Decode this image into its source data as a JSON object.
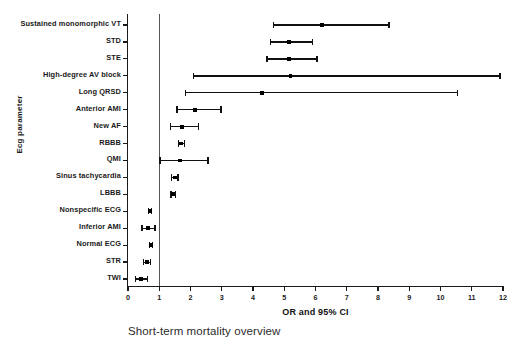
{
  "caption": "Short-term mortality overview",
  "chart_data": {
    "type": "scatter",
    "plot_style": "forest-plot",
    "title": "",
    "subtitle": "",
    "xlabel": "OR and 95% CI",
    "ylabel": "Ecg parameter",
    "xlim": [
      0,
      12
    ],
    "xticks": [
      0,
      1,
      2,
      3,
      4,
      5,
      6,
      7,
      8,
      9,
      10,
      11,
      12
    ],
    "xticklabels": [
      "0",
      "1",
      "2",
      "3",
      "4",
      "5",
      "6",
      "7",
      "8",
      "9",
      "10",
      "11",
      "12"
    ],
    "grid": false,
    "legend": "none",
    "reference_line": 1,
    "categories": [
      "Sustained monomorphic VT",
      "STD",
      "STE",
      "High-degree AV block",
      "Long QRSD",
      "Anterior AMI",
      "New AF",
      "RBBB",
      "QMI",
      "Sinus tachycardia",
      "LBBB",
      "Nonspecific ECG",
      "Inferior AMI",
      "Normal ECG",
      "STR",
      "TWI"
    ],
    "points": [
      {
        "label": "Sustained monomorphic VT",
        "or": 6.2,
        "ci_low": 4.65,
        "ci_high": 8.35
      },
      {
        "label": "STD",
        "or": 5.15,
        "ci_low": 4.55,
        "ci_high": 5.9
      },
      {
        "label": "STE",
        "or": 5.15,
        "ci_low": 4.45,
        "ci_high": 6.05
      },
      {
        "label": "High-degree AV block",
        "or": 5.2,
        "ci_low": 2.1,
        "ci_high": 11.9
      },
      {
        "label": "Long QRSD",
        "or": 4.3,
        "ci_low": 1.85,
        "ci_high": 10.55
      },
      {
        "label": "Anterior AMI",
        "or": 2.15,
        "ci_low": 1.57,
        "ci_high": 2.98
      },
      {
        "label": "New AF",
        "or": 1.73,
        "ci_low": 1.35,
        "ci_high": 2.25
      },
      {
        "label": "RBBB",
        "or": 1.7,
        "ci_low": 1.62,
        "ci_high": 1.8
      },
      {
        "label": "QMI",
        "or": 1.66,
        "ci_low": 1.02,
        "ci_high": 2.56
      },
      {
        "label": "Sinus tachycardia",
        "or": 1.5,
        "ci_low": 1.4,
        "ci_high": 1.6
      },
      {
        "label": "LBBB",
        "or": 1.45,
        "ci_low": 1.38,
        "ci_high": 1.52
      },
      {
        "label": "Nonspecific ECG",
        "or": 0.71,
        "ci_low": 0.66,
        "ci_high": 0.76
      },
      {
        "label": "Inferior AMI",
        "or": 0.64,
        "ci_low": 0.45,
        "ci_high": 0.86
      },
      {
        "label": "Normal ECG",
        "or": 0.73,
        "ci_low": 0.68,
        "ci_high": 0.79
      },
      {
        "label": "STR",
        "or": 0.6,
        "ci_low": 0.5,
        "ci_high": 0.73
      },
      {
        "label": "TWI",
        "or": 0.42,
        "ci_low": 0.24,
        "ci_high": 0.63
      }
    ]
  }
}
